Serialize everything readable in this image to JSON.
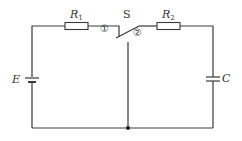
{
  "diagram": {
    "type": "circuit",
    "components": {
      "resistor1": {
        "symbol": "R",
        "subscript": "1"
      },
      "resistor2": {
        "symbol": "R",
        "subscript": "2"
      },
      "switch": {
        "label": "S",
        "terminal1": "①",
        "terminal2": "②"
      },
      "battery": {
        "label": "E"
      },
      "capacitor": {
        "label": "C"
      }
    },
    "colors": {
      "line": "#3a3a3a",
      "text": "#333333",
      "background": "#ffffff"
    }
  }
}
